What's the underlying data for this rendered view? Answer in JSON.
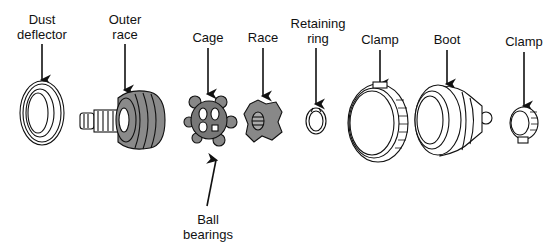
{
  "diagram": {
    "type": "exploded-view",
    "colors": {
      "line": "#111111",
      "part_fill": "#8a8a8a",
      "background": "#ffffff"
    },
    "parts": [
      {
        "id": "dust-deflector",
        "label_line1": "Dust",
        "label_line2": "deflector",
        "x": 42
      },
      {
        "id": "outer-race",
        "label_line1": "Outer",
        "label_line2": "race",
        "x": 125
      },
      {
        "id": "cage",
        "label_line1": "Cage",
        "label_line2": "",
        "x": 208
      },
      {
        "id": "race",
        "label_line1": "Race",
        "label_line2": "",
        "x": 263
      },
      {
        "id": "retaining-ring",
        "label_line1": "Retaining",
        "label_line2": "ring",
        "x": 316
      },
      {
        "id": "clamp-large",
        "label_line1": "Clamp",
        "label_line2": "",
        "x": 380
      },
      {
        "id": "boot",
        "label_line1": "Boot",
        "label_line2": "",
        "x": 447
      },
      {
        "id": "clamp-small",
        "label_line1": "Clamp",
        "label_line2": "",
        "x": 524
      }
    ],
    "bottom_label": {
      "line1": "Ball",
      "line2": "bearings"
    }
  }
}
